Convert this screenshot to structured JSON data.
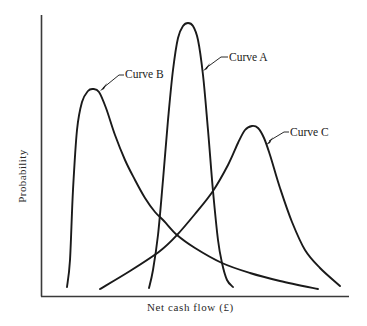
{
  "chart_data": {
    "type": "line",
    "title": "",
    "xlabel": "Net cash flow (£)",
    "ylabel": "Probability",
    "grid": false,
    "legend": "none (curves labelled directly with leader lines)",
    "axis_ticks": "none",
    "series": [
      {
        "name": "Curve A",
        "description": "Narrow, tall distribution centred in the middle of the net cash flow range",
        "relative_peak_x": 0.48,
        "relative_peak_height": 0.97,
        "relative_x_range": [
          0.35,
          0.62
        ],
        "points_px": [
          [
            149,
            288
          ],
          [
            153,
            270
          ],
          [
            158,
            235
          ],
          [
            163,
            180
          ],
          [
            168,
            120
          ],
          [
            173,
            70
          ],
          [
            178,
            38
          ],
          [
            183,
            26
          ],
          [
            188,
            23
          ],
          [
            193,
            26
          ],
          [
            198,
            40
          ],
          [
            203,
            75
          ],
          [
            208,
            130
          ],
          [
            213,
            191
          ],
          [
            218,
            240
          ],
          [
            222,
            263
          ],
          [
            227,
            280
          ],
          [
            233,
            287
          ]
        ]
      },
      {
        "name": "Curve B",
        "description": "Left-shifted distribution, peak near low net cash flow, long right tail (positive skew)",
        "relative_peak_x": 0.17,
        "relative_peak_height": 0.74,
        "relative_x_range": [
          0.08,
          0.89
        ],
        "points_px": [
          [
            67,
            287
          ],
          [
            70,
            260
          ],
          [
            73,
            190
          ],
          [
            77,
            130
          ],
          [
            82,
            102
          ],
          [
            88,
            91
          ],
          [
            93,
            89
          ],
          [
            99,
            92
          ],
          [
            106,
            108
          ],
          [
            115,
            135
          ],
          [
            125,
            160
          ],
          [
            135,
            180
          ],
          [
            145,
            198
          ],
          [
            155,
            212
          ],
          [
            164,
            221
          ],
          [
            177,
            235
          ],
          [
            195,
            248
          ],
          [
            222,
            263
          ],
          [
            250,
            273
          ],
          [
            280,
            281
          ],
          [
            318,
            289
          ]
        ]
      },
      {
        "name": "Curve C",
        "description": "Right-shifted distribution, long left tail (negative skew), peak at high net cash flow",
        "relative_peak_x": 0.69,
        "relative_peak_height": 0.62,
        "relative_x_range": [
          0.19,
          0.97
        ],
        "points_px": [
          [
            100,
            289
          ],
          [
            130,
            271
          ],
          [
            160,
            251
          ],
          [
            177,
            235
          ],
          [
            195,
            214
          ],
          [
            213,
            191
          ],
          [
            228,
            165
          ],
          [
            238,
            143
          ],
          [
            245,
            130
          ],
          [
            252,
            126
          ],
          [
            258,
            128
          ],
          [
            264,
            138
          ],
          [
            270,
            155
          ],
          [
            280,
            188
          ],
          [
            292,
            222
          ],
          [
            305,
            250
          ],
          [
            320,
            268
          ],
          [
            340,
            286
          ]
        ]
      }
    ],
    "annotations": [
      {
        "text": "Curve A",
        "anchor_px": [
          203,
          70
        ],
        "label_px": [
          229,
          52
        ]
      },
      {
        "text": "Curve B",
        "anchor_px": [
          100,
          90
        ],
        "label_px": [
          124,
          69
        ]
      },
      {
        "text": "Curve C",
        "anchor_px": [
          266,
          144
        ],
        "label_px": [
          290,
          127
        ]
      }
    ],
    "axes_px": {
      "origin": [
        41,
        296
      ],
      "y_top": 15,
      "x_right": 349
    }
  },
  "labels": {
    "curve_a": "Curve A",
    "curve_b": "Curve B",
    "curve_c": "Curve C",
    "xlabel": "Net cash flow (£)",
    "ylabel": "Probability"
  },
  "colors": {
    "ink": "#1a1a1a",
    "axis": "#3a3a3a",
    "background": "#ffffff"
  }
}
